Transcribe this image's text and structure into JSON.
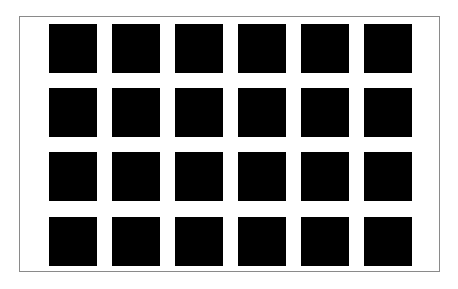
{
  "figure": {
    "rows": 4,
    "columns": 6,
    "square_color": "#000000",
    "background_color": "#ffffff",
    "border_color": "#8a8a8a"
  }
}
